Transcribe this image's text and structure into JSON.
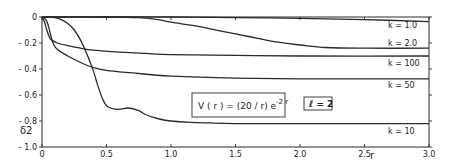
{
  "chart_data": {
    "type": "line",
    "title": "",
    "xlabel": "r",
    "ylabel": "δ2",
    "xlim": [
      0,
      3.0
    ],
    "ylim": [
      -1.0,
      0
    ],
    "grid": false,
    "x_ticks": [
      {
        "value": 0,
        "label": "0"
      },
      {
        "value": 0.5,
        "label": "0.5"
      },
      {
        "value": 1.0,
        "label": "1.0"
      },
      {
        "value": 1.5,
        "label": "1.5"
      },
      {
        "value": 2.0,
        "label": "2.0"
      },
      {
        "value": 2.5,
        "label": "2.5"
      },
      {
        "value": 3.0,
        "label": "3.0"
      }
    ],
    "y_ticks": [
      {
        "value": 0,
        "label": "0"
      },
      {
        "value": -0.2,
        "label": "- 0.2"
      },
      {
        "value": -0.4,
        "label": "- 0.4"
      },
      {
        "value": -0.6,
        "label": "- 0.6"
      },
      {
        "value": -0.8,
        "label": "- 0.8"
      },
      {
        "value": -1.0,
        "label": "- 1.0"
      }
    ],
    "annotations": [
      {
        "text": "V(r) = (20/r) e^(-2r)",
        "display": "V ( r ) = (20 / r) e",
        "superscript": "-2 r",
        "boxed": true
      },
      {
        "text": "ℓ = 2",
        "display": "ℓ = 2",
        "boxed": true
      }
    ],
    "legend_position": "inline-right",
    "series": [
      {
        "name": "k = 1.0",
        "label_y": -0.06,
        "x": [
          0,
          0.5,
          1.0,
          1.5,
          2.0,
          2.5,
          3.0
        ],
        "values": [
          0,
          0,
          0,
          -0.005,
          -0.01,
          -0.02,
          -0.035
        ]
      },
      {
        "name": "k = 2.0",
        "label_y": -0.2,
        "x": [
          0,
          0.5,
          0.75,
          0.9,
          1.0,
          1.2,
          1.4,
          1.6,
          1.8,
          2.0,
          2.2,
          2.5,
          3.0
        ],
        "values": [
          0,
          0,
          -0.005,
          -0.02,
          -0.04,
          -0.07,
          -0.11,
          -0.15,
          -0.19,
          -0.215,
          -0.235,
          -0.24,
          -0.24
        ]
      },
      {
        "name": "k = 100",
        "label_y": -0.35,
        "x": [
          0,
          0.02,
          0.04,
          0.06,
          0.08,
          0.12,
          0.2,
          0.3,
          0.4,
          0.6,
          0.8,
          1.0,
          1.5,
          2.0,
          3.0
        ],
        "values": [
          0,
          -0.04,
          -0.11,
          -0.16,
          -0.18,
          -0.2,
          -0.22,
          -0.24,
          -0.255,
          -0.27,
          -0.28,
          -0.29,
          -0.295,
          -0.3,
          -0.3
        ]
      },
      {
        "name": "k = 50",
        "label_y": -0.52,
        "x": [
          0,
          0.03,
          0.05,
          0.07,
          0.09,
          0.12,
          0.2,
          0.3,
          0.4,
          0.5,
          0.7,
          1.0,
          1.5,
          2.0,
          3.0
        ],
        "values": [
          0,
          -0.02,
          -0.07,
          -0.15,
          -0.21,
          -0.25,
          -0.3,
          -0.35,
          -0.39,
          -0.41,
          -0.43,
          -0.455,
          -0.47,
          -0.475,
          -0.475
        ]
      },
      {
        "name": "k = 10",
        "label_y": -0.88,
        "x": [
          0,
          0.1,
          0.15,
          0.2,
          0.25,
          0.3,
          0.35,
          0.4,
          0.43,
          0.47,
          0.51,
          0.59,
          0.67,
          0.75,
          0.8,
          0.91,
          1.0,
          1.15,
          1.3,
          1.5,
          2.0,
          3.0
        ],
        "values": [
          0,
          -0.005,
          -0.02,
          -0.05,
          -0.1,
          -0.18,
          -0.29,
          -0.42,
          -0.52,
          -0.63,
          -0.69,
          -0.71,
          -0.7,
          -0.72,
          -0.75,
          -0.785,
          -0.8,
          -0.81,
          -0.815,
          -0.82,
          -0.82,
          -0.82
        ]
      }
    ]
  }
}
